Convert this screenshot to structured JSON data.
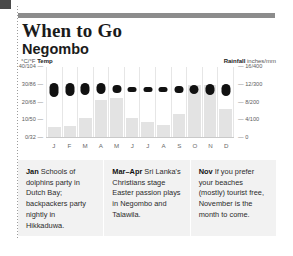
{
  "header": {
    "title": "When to Go",
    "subtitle": "Negombo"
  },
  "chart_data": {
    "type": "bar",
    "categories": [
      "J",
      "F",
      "M",
      "A",
      "M",
      "J",
      "J",
      "A",
      "S",
      "O",
      "N",
      "D"
    ],
    "temp_axis": {
      "label": "Temp",
      "unit": "°C/°F",
      "ticks": [
        "40/104",
        "30/86",
        "20/68",
        "10/50",
        "0/32"
      ],
      "tick_values": [
        40,
        30,
        20,
        10,
        0
      ],
      "ylim": [
        0,
        40
      ]
    },
    "rain_axis": {
      "label": "Rainfall",
      "unit": "inches/mm",
      "ticks": [
        "16/400",
        "12/300",
        "8/200",
        "4/100",
        "0"
      ],
      "tick_values": [
        16,
        12,
        8,
        4,
        0
      ],
      "ylim": [
        0,
        16
      ]
    },
    "series": [
      {
        "name": "Temperature range (°C)",
        "type": "range-bar",
        "min": [
          23,
          23.5,
          24,
          25,
          25.5,
          26,
          26,
          26,
          25.5,
          25,
          24,
          23.5
        ],
        "max": [
          31,
          31,
          31,
          31,
          30,
          29,
          28.5,
          29,
          29.5,
          30,
          30.5,
          30.5
        ]
      },
      {
        "name": "Rainfall (inches)",
        "type": "bar",
        "values": [
          2.5,
          2.8,
          4.5,
          8.5,
          9.0,
          4.5,
          3.5,
          3.0,
          5.5,
          12.0,
          12.0,
          6.5
        ]
      }
    ],
    "grid": false,
    "legend": "axis-labels"
  },
  "captions": [
    {
      "month": "Jan",
      "text": " Schools of dolphins party in Dutch Bay; backpackers party nightly in Hikkaduwa."
    },
    {
      "month": "Mar–Apr",
      "text": " Sri Lanka's Christians stage Easter passion plays in Negombo and Talawila."
    },
    {
      "month": "Nov",
      "text": " If you prefer your beaches (mostly) tourist free, November is the month to come."
    }
  ]
}
